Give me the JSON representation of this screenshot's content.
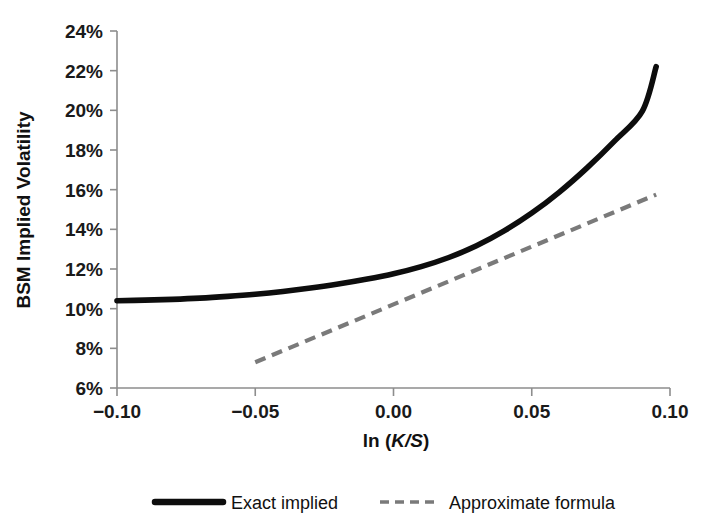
{
  "chart_data": {
    "type": "line",
    "title": "",
    "xlabel": "ln (K/S)",
    "xlabel_parts": {
      "prefix": "ln (",
      "italic": "K/S",
      "suffix": ")"
    },
    "ylabel": "BSM Implied Volatility",
    "xlim": [
      -0.1,
      0.1
    ],
    "ylim": [
      0.06,
      0.24
    ],
    "grid": false,
    "legend_position": "bottom",
    "x_ticks": [
      -0.1,
      -0.05,
      0.0,
      0.05,
      0.1
    ],
    "x_tick_labels": [
      "−0.10",
      "−0.05",
      "0.00",
      "0.05",
      "0.10"
    ],
    "y_ticks": [
      0.06,
      0.08,
      0.1,
      0.12,
      0.14,
      0.16,
      0.18,
      0.2,
      0.22,
      0.24
    ],
    "y_tick_labels": [
      "6%",
      "8%",
      "10%",
      "12%",
      "14%",
      "16%",
      "18%",
      "20%",
      "22%",
      "24%"
    ],
    "series": [
      {
        "name": "Exact implied",
        "style": "solid",
        "color": "#0d0d0d",
        "width": 5.6,
        "x": [
          -0.1,
          -0.09,
          -0.08,
          -0.07,
          -0.06,
          -0.05,
          -0.04,
          -0.03,
          -0.02,
          -0.01,
          0.0,
          0.01,
          0.02,
          0.03,
          0.04,
          0.05,
          0.06,
          0.07,
          0.08,
          0.09,
          0.095
        ],
        "y": [
          0.104,
          0.1043,
          0.1047,
          0.1053,
          0.1062,
          0.1073,
          0.1087,
          0.1104,
          0.1124,
          0.1148,
          0.1176,
          0.1212,
          0.1258,
          0.1317,
          0.1392,
          0.1482,
          0.1588,
          0.171,
          0.1846,
          0.1996,
          0.222
        ]
      },
      {
        "name": "Approximate formula",
        "style": "dashed",
        "color": "#7a7a7a",
        "width": 4.2,
        "dash": "11 7",
        "x": [
          -0.05,
          0.095
        ],
        "y": [
          0.073,
          0.1575
        ]
      }
    ],
    "legend": [
      {
        "label": "Exact implied",
        "style": "solid",
        "color": "#0d0d0d",
        "width": 6.5
      },
      {
        "label": "Approximate formula",
        "style": "dashed",
        "color": "#7a7a7a",
        "width": 3.6,
        "dash": "9 6"
      }
    ]
  },
  "plot_geometry": {
    "left": 117,
    "right": 670,
    "top": 31,
    "bottom": 388
  }
}
